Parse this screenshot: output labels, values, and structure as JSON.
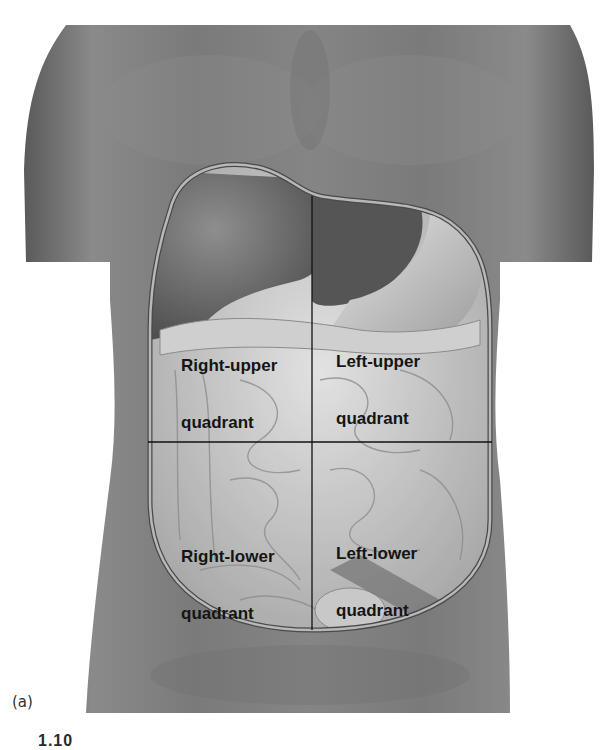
{
  "figure": {
    "panel_label": "(a)",
    "caption_fragment": "1.10",
    "colors": {
      "skin_dark": "#5e5e5e",
      "skin_mid": "#7d7d7d",
      "skin_light": "#9a9a9a",
      "organ_light": "#d9d9d9",
      "organ_dark": "#6a6a6a",
      "outline": "#b8b8b8",
      "divider": "#111111",
      "label": "#151515"
    }
  },
  "quadrants": [
    {
      "id": "ruq",
      "line1": "Right-upper",
      "line2": "quadrant"
    },
    {
      "id": "luq",
      "line1": "Left-upper",
      "line2": "quadrant"
    },
    {
      "id": "rlq",
      "line1": "Right-lower",
      "line2": "quadrant"
    },
    {
      "id": "llq",
      "line1": "Left-lower",
      "line2": "quadrant"
    }
  ]
}
